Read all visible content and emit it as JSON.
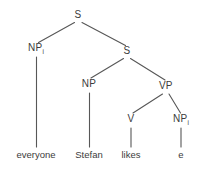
{
  "figure": {
    "kind": "syntax-tree",
    "background_color": "#ffffff",
    "line_color": "#575757",
    "text_color": "#3c3c3c"
  },
  "nodes": {
    "root_s": {
      "label": "S",
      "sub": "",
      "x": 78,
      "y": 16
    },
    "np_i_top": {
      "label": "NP",
      "sub": "i",
      "x": 36,
      "y": 49
    },
    "s_embedded": {
      "label": "S",
      "sub": "",
      "x": 127,
      "y": 52
    },
    "np_subject": {
      "label": "NP",
      "sub": "",
      "x": 89,
      "y": 85
    },
    "vp": {
      "label": "VP",
      "sub": "",
      "x": 166,
      "y": 87
    },
    "v": {
      "label": "V",
      "sub": "",
      "x": 131,
      "y": 120
    },
    "np_i_object": {
      "label": "NP",
      "sub": "i",
      "x": 181,
      "y": 120
    }
  },
  "leaves": {
    "everyone": {
      "label": "everyone",
      "x": 36,
      "y": 155
    },
    "stefan": {
      "label": "Stefan",
      "x": 89,
      "y": 155
    },
    "likes": {
      "label": "likes",
      "x": 131,
      "y": 155
    },
    "trace_e": {
      "label": "e",
      "x": 181,
      "y": 155
    }
  }
}
